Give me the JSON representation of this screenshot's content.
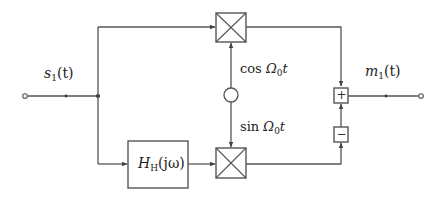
{
  "diagram": {
    "type": "block-diagram",
    "input_signal": {
      "name": "s",
      "subscript": "1",
      "arg": "(t)"
    },
    "output_signal": {
      "name": "m",
      "subscript": "1",
      "arg": "(t)"
    },
    "hilbert_block": {
      "name": "H",
      "subscript": "H",
      "arg": "(jω)"
    },
    "carrier_top": {
      "func": "cos",
      "omega": "Ω",
      "omega_sub": "0",
      "var": "t"
    },
    "carrier_bottom": {
      "func": "sin",
      "omega": "Ω",
      "omega_sub": "0",
      "var": "t"
    },
    "summer_top_sign": "+",
    "summer_bottom_sign": "−",
    "colors": {
      "line": "#555555",
      "background": "#ffffff",
      "text": "#222222"
    }
  }
}
